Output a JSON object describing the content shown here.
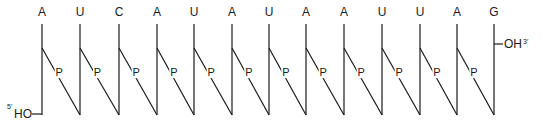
{
  "diagram": {
    "title": "RNA strand backbone",
    "sequence": [
      "A",
      "U",
      "C",
      "A",
      "U",
      "A",
      "U",
      "A",
      "A",
      "U",
      "U",
      "A",
      "G"
    ],
    "phosphate_label": "P",
    "five_prime": {
      "prime": "5′",
      "group": "HO"
    },
    "three_prime": {
      "group": "OH",
      "prime": "3′"
    },
    "layout": {
      "x_positions": [
        42,
        80,
        119,
        157,
        194,
        232,
        269,
        306,
        344,
        382,
        420,
        457,
        494
      ],
      "letter_y": 16,
      "top_y": 24,
      "branch_y": 48,
      "bottom_y": 115,
      "oh_y": 44
    },
    "colors": {
      "ink": "#1a1a1a",
      "background": "#ffffff"
    }
  }
}
